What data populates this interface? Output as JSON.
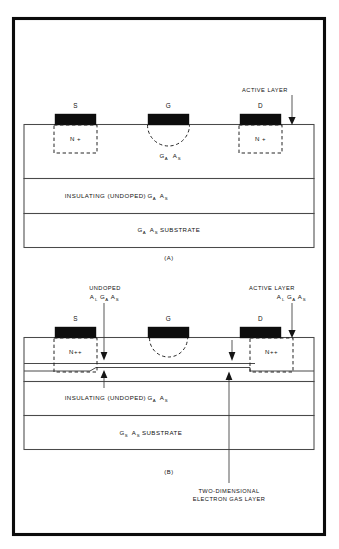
{
  "figure": {
    "title_present": false,
    "panels": [
      {
        "id": "A",
        "caption": "(A)",
        "device": "MESFET",
        "contacts": [
          {
            "label": "S",
            "name": "source"
          },
          {
            "label": "G",
            "name": "gate"
          },
          {
            "label": "D",
            "name": "drain"
          }
        ],
        "doped_regions": [
          {
            "label": "N +",
            "name": "source-n-plus"
          },
          {
            "label": "N +",
            "name": "drain-n-plus"
          }
        ],
        "gate_recess_label": {
          "base1": "G",
          "sub1": "A",
          "base2": "A",
          "sub2": "S"
        },
        "callouts": [
          {
            "label": "ACTIVE LAYER",
            "name": "active-layer-callout"
          }
        ],
        "layers": [
          {
            "name": "active-layer",
            "text_parts": null
          },
          {
            "name": "insulating-layer",
            "prefix": "INSULATING  (UNDOPED)  ",
            "base1": "G",
            "sub1": "A",
            "base2": "A",
            "sub2": "S"
          },
          {
            "name": "substrate-layer",
            "base1": "G",
            "sub1": "A",
            "base2": "A",
            "sub2": "S",
            "suffix": "  SUBSTRATE"
          }
        ]
      },
      {
        "id": "B",
        "caption": "(B)",
        "device": "HEMT",
        "contacts": [
          {
            "label": "S",
            "name": "source"
          },
          {
            "label": "G",
            "name": "gate"
          },
          {
            "label": "D",
            "name": "drain"
          }
        ],
        "doped_regions": [
          {
            "label": "N++",
            "name": "source-n-plus-plus"
          },
          {
            "label": "N++",
            "name": "drain-n-plus-plus"
          }
        ],
        "callouts": [
          {
            "name": "undoped-algaas-callout",
            "line1": "UNDOPED",
            "formula": [
              {
                "base": "A",
                "sub": "L"
              },
              {
                "base": "G",
                "sub": "A"
              },
              {
                "base": "A",
                "sub": "S"
              }
            ]
          },
          {
            "name": "active-layer-algaas-callout",
            "line1": "ACTIVE LAYER",
            "formula": [
              {
                "base": "A",
                "sub": "L"
              },
              {
                "base": "G",
                "sub": "A"
              },
              {
                "base": "A",
                "sub": "S"
              }
            ]
          },
          {
            "name": "two-dimensional-electron-gas-callout",
            "line1": "TWO-DIMENSIONAL",
            "line2": "ELECTRON GAS LAYER"
          }
        ],
        "layers": [
          {
            "name": "insulating-layer",
            "prefix": "INSULATING  (UNDOPED)  ",
            "base1": "G",
            "sub1": "A",
            "base2": "A",
            "sub2": "S"
          },
          {
            "name": "substrate-layer",
            "base1": "G",
            "sub1": "S",
            "base2": "A",
            "sub2": "S",
            "suffix": "  SUBSTRATE"
          }
        ]
      }
    ],
    "colors": {
      "background": "#ffffff",
      "frame": "#0b0b0b",
      "contact_fill": "#0d0d0d",
      "layer_line": "#4a4a4a",
      "dashed_line": "#1a1a1a",
      "text": "#111111"
    }
  }
}
